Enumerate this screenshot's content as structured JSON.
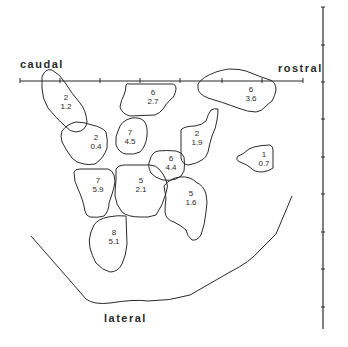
{
  "orientation_labels": {
    "caudal": "caudal",
    "rostral": "rostral",
    "lateral": "lateral"
  },
  "horizontal_axis": {
    "y": 81,
    "x_start": 20,
    "x_end": 303,
    "ticks_x": [
      20,
      60,
      100,
      140,
      180,
      222,
      262,
      303
    ]
  },
  "vertical_scale": {
    "x": 323,
    "y_start": 7,
    "y_end": 329,
    "ticks_y": [
      7,
      45,
      82,
      119,
      157,
      194,
      232,
      269,
      307
    ]
  },
  "regions": [
    {
      "id": "r1",
      "top": "2",
      "bottom": "1.2",
      "x": 66,
      "y": 100
    },
    {
      "id": "r2",
      "top": "6",
      "bottom": "2.7",
      "x": 153,
      "y": 95
    },
    {
      "id": "r3",
      "top": "6",
      "bottom": "3.6",
      "x": 251,
      "y": 92
    },
    {
      "id": "r4",
      "top": "2",
      "bottom": "0.4",
      "x": 96,
      "y": 140
    },
    {
      "id": "r5",
      "top": "7",
      "bottom": "4.5",
      "x": 130,
      "y": 135
    },
    {
      "id": "r6",
      "top": "2",
      "bottom": "1.9",
      "x": 197,
      "y": 136
    },
    {
      "id": "r7",
      "top": "1",
      "bottom": "0.7",
      "x": 264,
      "y": 157
    },
    {
      "id": "r8",
      "top": "6",
      "bottom": "4.4",
      "x": 171,
      "y": 161
    },
    {
      "id": "r9",
      "top": "7",
      "bottom": "5.9",
      "x": 98,
      "y": 183
    },
    {
      "id": "r10",
      "top": "5",
      "bottom": "2.1",
      "x": 141,
      "y": 183
    },
    {
      "id": "r11",
      "top": "5",
      "bottom": "1.6",
      "x": 191,
      "y": 196
    },
    {
      "id": "r12",
      "top": "8",
      "bottom": "5.1",
      "x": 114,
      "y": 235
    }
  ]
}
